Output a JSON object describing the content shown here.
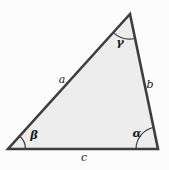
{
  "figure": {
    "side_labels": {
      "a": "a",
      "b": "b",
      "c": "c"
    },
    "angle_labels": {
      "gamma": "γ",
      "beta": "β",
      "alpha": "α"
    },
    "colors": {
      "triangle_fill": "#ededed",
      "triangle_stroke": "#3e3e3e",
      "label_color": "#1b1b1b",
      "background": "#fcfcfc"
    }
  }
}
